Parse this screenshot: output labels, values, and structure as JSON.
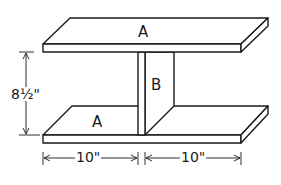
{
  "diagram": {
    "type": "shelf-assembly-drawing",
    "parts": {
      "top_board": {
        "label": "A"
      },
      "bottom_board": {
        "label": "A"
      },
      "divider": {
        "label": "B"
      }
    },
    "dimensions": {
      "height": "8½\"",
      "left_width": "10\"",
      "right_width": "10\""
    },
    "colors": {
      "line": "#1a1a1a",
      "background": "#ffffff"
    }
  }
}
